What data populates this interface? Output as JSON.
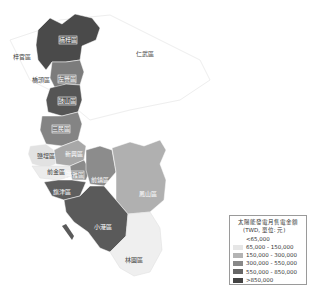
{
  "map": {
    "region": "Kaohsiung",
    "districts": [
      {
        "name": "楠梓區",
        "class": ">850,000",
        "color": "#4a4a4a"
      },
      {
        "name": "左營區",
        "class": "300,000 - 550,000",
        "color": "#7c7c7c"
      },
      {
        "name": "鼓山區",
        "class": "550,000 - 850,000",
        "color": "#5c5c5c"
      },
      {
        "name": "三民區",
        "class": "300,000 - 550,000",
        "color": "#8a8a8a"
      },
      {
        "name": "鹽埕區",
        "class": "65,000 - 150,000",
        "color": "#d6d6d6"
      },
      {
        "name": "新興區",
        "class": "150,000 - 300,000",
        "color": "#a8a8a8"
      },
      {
        "name": "前金區",
        "class": "<65,000",
        "color": "#ececec"
      },
      {
        "name": "苓雅區",
        "class": "300,000 - 550,000",
        "color": "#7c7c7c"
      },
      {
        "name": "前鎮區",
        "class": "300,000 - 550,000",
        "color": "#868686"
      },
      {
        "name": "鳳山區",
        "class": "150,000 - 300,000",
        "color": "#b0b0b0"
      },
      {
        "name": "旗津區",
        "class": "550,000 - 850,000",
        "color": "#5e5e5e"
      },
      {
        "name": "小港區",
        "class": "550,000 - 850,000",
        "color": "#5a5a5a"
      },
      {
        "name": "林園區",
        "class": "<65,000",
        "color": "#f0f0f0"
      }
    ],
    "outside_labels": [
      "橋頭區",
      "梓官區",
      "仁武區"
    ]
  },
  "legend": {
    "title": "太陽能發電月售電金額",
    "subtitle": "(TWD, 單位: 元)",
    "items": [
      {
        "label": "<65,000",
        "color": "#ffffff"
      },
      {
        "label": "65,000 - 150,000",
        "color": "#e6e6e6"
      },
      {
        "label": "150,000 - 300,000",
        "color": "#b3b3b3"
      },
      {
        "label": "300,000 - 550,000",
        "color": "#888888"
      },
      {
        "label": "550,000 - 850,000",
        "color": "#666666"
      },
      {
        "label": ">850,000",
        "color": "#444444"
      }
    ]
  }
}
